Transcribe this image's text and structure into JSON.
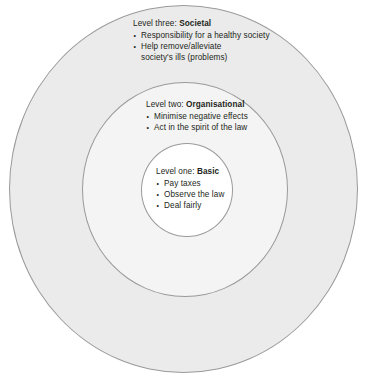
{
  "diagram": {
    "type": "concentric-circles",
    "colors": {
      "outer_fill": "#ebebeb",
      "middle_fill": "#f4f4f4",
      "inner_fill": "#ffffff",
      "stroke": "#9a9a9a",
      "text": "#231f20"
    },
    "levels": [
      {
        "id": "societal",
        "ring": "outer",
        "label_prefix": "Level three:",
        "label_name": "Societal",
        "bullets": [
          "Responsibility for a healthy society",
          "Help remove/alleviate society's ills (problems)"
        ]
      },
      {
        "id": "organisational",
        "ring": "middle",
        "label_prefix": "Level two:",
        "label_name": "Organisational",
        "bullets": [
          "Minimise negative effects",
          "Act in the spirit of the law"
        ]
      },
      {
        "id": "basic",
        "ring": "inner",
        "label_prefix": "Level one:",
        "label_name": "Basic",
        "bullets": [
          "Pay taxes",
          "Observe the law",
          "Deal fairly"
        ]
      }
    ]
  }
}
